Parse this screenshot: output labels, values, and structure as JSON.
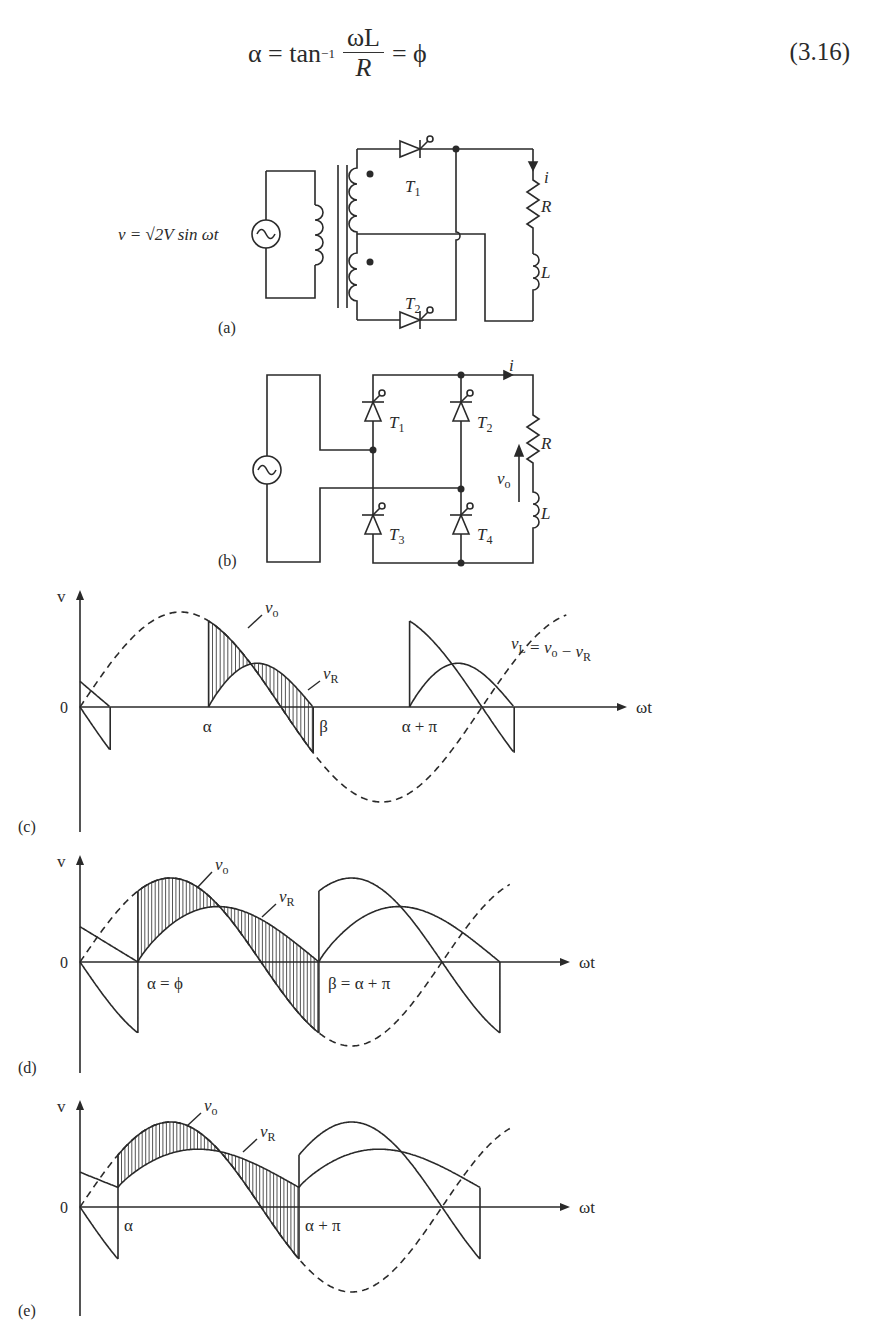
{
  "equation": {
    "lhs": "α = tan",
    "exponent": "−1",
    "numerator": "ωL",
    "denominator": "R",
    "rhs": "= ϕ",
    "number": "(3.16)"
  },
  "circuit_a": {
    "panel_label": "(a)",
    "source_label": "v = √2V sin ωt",
    "thyristors": [
      "T1",
      "T2"
    ],
    "load": {
      "current": "i",
      "resistor": "R",
      "inductor": "L"
    }
  },
  "circuit_b": {
    "panel_label": "(b)",
    "thyristors": [
      "T1",
      "T2",
      "T3",
      "T4"
    ],
    "load": {
      "current": "i",
      "resistor": "R",
      "inductor": "L",
      "output_voltage": "vo"
    }
  },
  "chart_data": [
    {
      "type": "line",
      "panel": "(c)",
      "title": "",
      "ylabel": "v",
      "xlabel": "ωt",
      "origin_label": "0",
      "tick_labels": [
        "α",
        "β",
        "α + π"
      ],
      "annotations": [
        "vo",
        "vR",
        "vL = vo − vR"
      ],
      "series": [
        {
          "name": "v (supply, dashed)",
          "style": "dashed"
        },
        {
          "name": "vo",
          "style": "solid"
        },
        {
          "name": "vR",
          "style": "solid"
        }
      ],
      "case": "α > ϕ, discontinuous current"
    },
    {
      "type": "line",
      "panel": "(d)",
      "ylabel": "v",
      "xlabel": "ωt",
      "origin_label": "0",
      "tick_labels": [
        "α = ϕ",
        "β = α + π"
      ],
      "annotations": [
        "vo",
        "vR"
      ],
      "series": [
        {
          "name": "v (supply, dashed)",
          "style": "dashed"
        },
        {
          "name": "vo",
          "style": "solid"
        },
        {
          "name": "vR",
          "style": "solid"
        }
      ],
      "case": "α = ϕ, boundary"
    },
    {
      "type": "line",
      "panel": "(e)",
      "ylabel": "v",
      "xlabel": "ωt",
      "origin_label": "0",
      "tick_labels": [
        "α",
        "α + π"
      ],
      "annotations": [
        "vo",
        "vR"
      ],
      "series": [
        {
          "name": "v (supply, dashed)",
          "style": "dashed"
        },
        {
          "name": "vo",
          "style": "solid"
        },
        {
          "name": "vR",
          "style": "solid"
        }
      ],
      "case": "α < ϕ, continuous current"
    }
  ],
  "colors": {
    "ink": "#2a2a2a",
    "background": "#ffffff"
  }
}
